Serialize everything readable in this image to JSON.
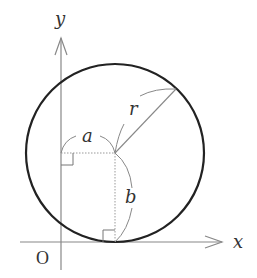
{
  "diagram": {
    "type": "circle-tangent-to-x-axis",
    "axes": {
      "x_label": "x",
      "y_label": "y",
      "origin_label": "O"
    },
    "circle": {
      "center_label": "(a, b)",
      "radius_label": "r"
    },
    "dimension_labels": {
      "horizontal": "a",
      "vertical": "b",
      "radius": "r"
    },
    "colors": {
      "axis": "#888888",
      "circle": "#222222",
      "guide": "#999999",
      "text": "#333333"
    }
  }
}
